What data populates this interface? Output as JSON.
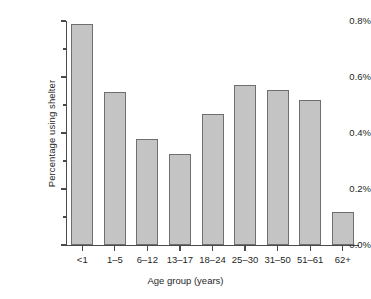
{
  "chart_data": {
    "type": "bar",
    "title": "",
    "xlabel": "Age group (years)",
    "ylabel": "Percentage using shelter",
    "categories": [
      "<1",
      "1–5",
      "6–12",
      "13–17",
      "18–24",
      "25–30",
      "31–50",
      "51–61",
      "62+"
    ],
    "values": [
      0.79,
      0.545,
      0.378,
      0.325,
      0.468,
      0.573,
      0.553,
      0.517,
      0.118
    ],
    "value_unit": "%",
    "ylim": [
      0.0,
      0.8
    ],
    "ytick_labels": [
      "0.0%",
      "0.2%",
      "0.4%",
      "0.6%",
      "0.8%"
    ],
    "ytick_values": [
      0.0,
      0.2,
      0.4,
      0.6,
      0.8
    ],
    "yminor_ticks": [
      0.1,
      0.3,
      0.5,
      0.7
    ],
    "grid": false,
    "legend": false,
    "bar_fill_color": "#c4c4c4",
    "bar_edge_color": "#6f6f6f",
    "axis_color": "#4a4a4a"
  },
  "figure": {
    "caption_artifact": ""
  }
}
